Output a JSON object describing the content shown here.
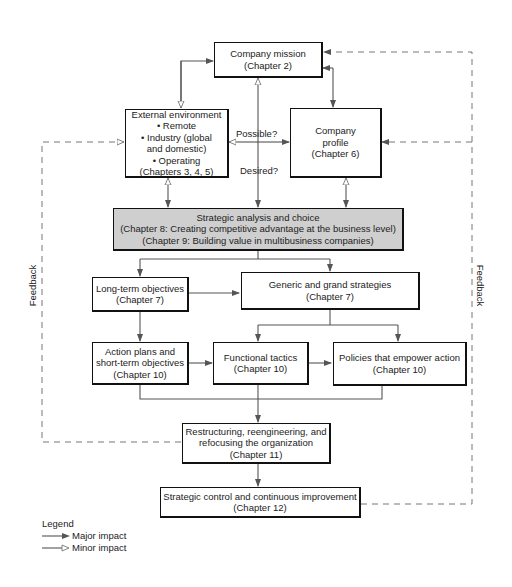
{
  "diagram": {
    "nodes": {
      "company_mission": {
        "title": "Company mission",
        "chapter": "(Chapter 2)"
      },
      "external_environment": {
        "title": "External environment",
        "items": [
          "• Remote",
          "• Industry (global",
          "and domestic)",
          "• Operating"
        ],
        "chapter": "(Chapters 3, 4, 5)"
      },
      "company_profile": {
        "title_line1": "Company",
        "title_line2": "profile",
        "chapter": "(Chapter 6)"
      },
      "strategic_analysis": {
        "title": "Strategic analysis and choice",
        "line2": "(Chapter 8: Creating competitive advantage at the business level)",
        "line3": "(Chapter 9: Building value in multibusiness companies)"
      },
      "long_term_objectives": {
        "title": "Long-term objectives",
        "chapter": "(Chapter 7)"
      },
      "generic_grand_strategies": {
        "title": "Generic and grand strategies",
        "chapter": "(Chapter 7)"
      },
      "action_plans": {
        "title_line1": "Action plans and",
        "title_line2": "short-term objectives",
        "chapter": "(Chapter 10)"
      },
      "functional_tactics": {
        "title": "Functional tactics",
        "chapter": "(Chapter 10)"
      },
      "policies": {
        "title": "Policies that empower action",
        "chapter": "(Chapter 10)"
      },
      "restructuring": {
        "title_line1": "Restructuring, reengineering, and",
        "title_line2": "refocusing the organization",
        "chapter": "(Chapter 11)"
      },
      "strategic_control": {
        "title": "Strategic control and continuous improvement",
        "chapter": "(Chapter 12)"
      }
    },
    "edge_labels": {
      "possible": "Possible?",
      "desired": "Desired?"
    },
    "feedback_left": "Feedback",
    "feedback_right": "Feedback",
    "legend": {
      "title": "Legend",
      "major": "Major impact",
      "minor": "Minor impact"
    },
    "colors": {
      "line": "#555555",
      "box_border": "#111111",
      "shaded_fill": "#cfcfcf",
      "dashed": "#777777"
    }
  }
}
